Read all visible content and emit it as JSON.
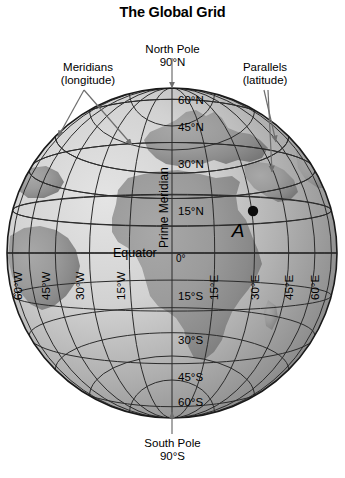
{
  "title": "The Global Grid",
  "callouts": {
    "north_pole": "North Pole",
    "north_pole_lat": "90°N",
    "south_pole": "South Pole",
    "south_pole_lat": "90°S",
    "meridians": "Meridians",
    "meridians_sub": "(longitude)",
    "parallels": "Parallels",
    "parallels_sub": "(latitude)"
  },
  "globe": {
    "equator_label": "Equator",
    "prime_meridian_label": "Prime Meridian",
    "point_label": "A",
    "point_position": {
      "lat": 15,
      "lon": 30
    },
    "center": {
      "x": 172,
      "y": 253
    },
    "radius": 165,
    "parallel_labels": [
      {
        "text": "60°N",
        "lat": 60
      },
      {
        "text": "45°N",
        "lat": 45
      },
      {
        "text": "30°N",
        "lat": 30
      },
      {
        "text": "15°N",
        "lat": 15
      },
      {
        "text": "0°",
        "lat": 0
      },
      {
        "text": "15°S",
        "lat": -15
      },
      {
        "text": "30°S",
        "lat": -30
      },
      {
        "text": "45°S",
        "lat": -45
      },
      {
        "text": "60°S",
        "lat": -60
      }
    ],
    "meridian_labels": [
      {
        "text": "60°W",
        "lon": -60
      },
      {
        "text": "45°W",
        "lon": -45
      },
      {
        "text": "30°W",
        "lon": -30
      },
      {
        "text": "15°W",
        "lon": -15
      },
      {
        "text": "15°E",
        "lon": 15
      },
      {
        "text": "30°E",
        "lon": 30
      },
      {
        "text": "45°E",
        "lon": 45
      },
      {
        "text": "60°E",
        "lon": 60
      }
    ],
    "grid_latitudes": [
      75,
      60,
      45,
      30,
      15,
      0,
      -15,
      -30,
      -45,
      -60,
      -75
    ],
    "grid_longitudes": [
      -75,
      -60,
      -45,
      -30,
      -15,
      0,
      15,
      30,
      45,
      60,
      75
    ]
  },
  "colors": {
    "ocean_lit": "#d9d9d9",
    "ocean_mid": "#b9b9b9",
    "ocean_shadow": "#8f8f8f",
    "land_lit": "#9a9a9a",
    "land_shadow": "#7a7a7a",
    "grid": "#2b2b2b",
    "outline": "#1a1a1a",
    "text": "#000000",
    "arrow": "#6e6e6e",
    "background": "#ffffff"
  }
}
